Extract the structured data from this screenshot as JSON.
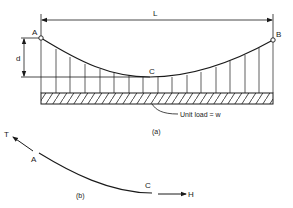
{
  "figure_a": {
    "span_label": "L",
    "sag_label": "d",
    "point_left": "A",
    "point_right": "B",
    "point_low": "C",
    "load_annotation": "Unit   load = w",
    "caption": "(a)"
  },
  "figure_b": {
    "tension_label": "T",
    "point_a": "A",
    "point_c": "C",
    "horizontal_label": "H",
    "caption": "(b)"
  },
  "colors": {
    "line": "#1a1a1a",
    "background": "#ffffff"
  }
}
